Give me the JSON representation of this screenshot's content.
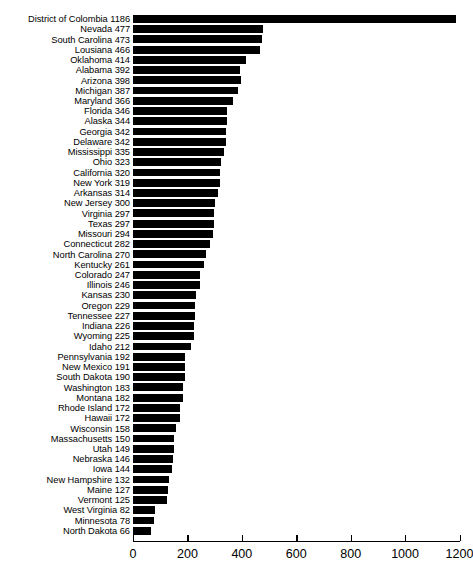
{
  "chart_data": {
    "type": "bar",
    "orientation": "horizontal",
    "title": "",
    "subtitle": "",
    "xlabel": "",
    "ylabel": "",
    "xlim": [
      0,
      1200
    ],
    "ylim": null,
    "grid": false,
    "legend": null,
    "bar_color": "#000000",
    "background_color": "#ffffff",
    "axis_color": "#000000",
    "xticks": [
      0,
      200,
      400,
      600,
      800,
      1000,
      1200
    ],
    "xtick_labels": [
      "0",
      "200",
      "400",
      "600",
      "800",
      "1000",
      "1200"
    ],
    "categories": [
      "District of Colombia",
      "Nevada",
      "South Carolina",
      "Lousiana",
      "Oklahoma",
      "Alabama",
      "Arizona",
      "Michigan",
      "Maryland",
      "Florida",
      "Alaska",
      "Georgia",
      "Delaware",
      "Mississippi",
      "Ohio",
      "California",
      "New York",
      "Arkansas",
      "New Jersey",
      "Virginia",
      "Texas",
      "Missouri",
      "Connecticut",
      "North Carolina",
      "Kentucky",
      "Colorado",
      "Illinois",
      "Kansas",
      "Oregon",
      "Tennessee",
      "Indiana",
      "Wyoming",
      "Idaho",
      "Pennsylvania",
      "New Mexico",
      "South Dakota",
      "Washington",
      "Montana",
      "Rhode Island",
      "Hawaii",
      "Wisconsin",
      "Massachusetts",
      "Utah",
      "Nebraska",
      "Iowa",
      "New Hampshire",
      "Maine",
      "Vermont",
      "West Virginia",
      "Minnesota",
      "North Dakota"
    ],
    "values": [
      1186,
      477,
      473,
      466,
      414,
      392,
      398,
      387,
      366,
      346,
      344,
      342,
      342,
      335,
      323,
      320,
      319,
      314,
      300,
      297,
      297,
      294,
      282,
      270,
      261,
      247,
      246,
      230,
      229,
      227,
      226,
      225,
      212,
      192,
      191,
      190,
      183,
      182,
      172,
      172,
      158,
      150,
      149,
      146,
      144,
      132,
      127,
      125,
      82,
      78,
      66
    ],
    "tick_labels_display": [
      "District of Colombia 1186",
      "Nevada 477",
      "South Carolina 473",
      "Lousiana 466",
      "Oklahoma 414",
      "Alabama 392",
      "Arizona 398",
      "Michigan 387",
      "Maryland 366",
      "Florida 346",
      "Alaska 344",
      "Georgia 342",
      "Delaware 342",
      "Mississippi 335",
      "Ohio 323",
      "California 320",
      "New York 319",
      "Arkansas 314",
      "New Jersey 300",
      "Virginia 297",
      "Texas 297",
      "Missouri 294",
      "Connecticut 282",
      "North Carolina 270",
      "Kentucky 261",
      "Colorado 247",
      "Illinois 246",
      "Kansas 230",
      "Oregon 229",
      "Tennessee 227",
      "Indiana 226",
      "Wyoming 225",
      "Idaho 212",
      "Pennsylvania 192",
      "New Mexico 191",
      "South Dakota 190",
      "Washington 183",
      "Montana 182",
      "Rhode Island 172",
      "Hawaii 172",
      "Wisconsin 158",
      "Massachusetts 150",
      "Utah 149",
      "Nebraska 146",
      "Iowa 144",
      "New Hampshire 132",
      "Maine 127",
      "Vermont 125",
      "West Virginia 82",
      "Minnesota 78",
      "North Dakota 66"
    ]
  }
}
